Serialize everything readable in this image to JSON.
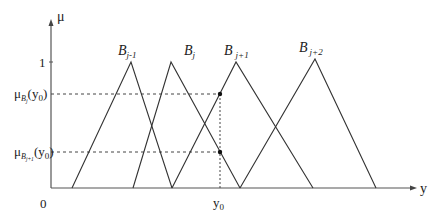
{
  "diagram": {
    "type": "fuzzy-membership-functions",
    "axes": {
      "y_axis_label": "μ",
      "x_axis_label": "y",
      "origin_label": "0",
      "y_tick_one": "1",
      "x_marker_label": "y",
      "x_marker_sub": "0"
    },
    "levels": {
      "upper": {
        "prefix": "μ",
        "sub_main": "B",
        "sub_index": "j",
        "arg": "(y",
        "arg_sub": "0",
        "close": ")"
      },
      "lower": {
        "prefix": "μ",
        "sub_main": "B",
        "sub_index": "j+1",
        "arg": "(y",
        "arg_sub": "0",
        "close": ")"
      }
    },
    "sets": [
      {
        "name": "B",
        "sub": "j-1",
        "left": 72,
        "peak": 131,
        "right": 172
      },
      {
        "name": "B",
        "sub": "j",
        "left": 133,
        "peak": 171,
        "right": 240
      },
      {
        "name": "B",
        "sub": "j+1",
        "left": 172,
        "peak": 236,
        "right": 313
      },
      {
        "name": "B",
        "sub": "j+2",
        "left": 240,
        "peak": 315,
        "right": 376
      }
    ],
    "colors": {
      "line": "#333333",
      "axis": "#555555",
      "dash": "#444444"
    }
  }
}
